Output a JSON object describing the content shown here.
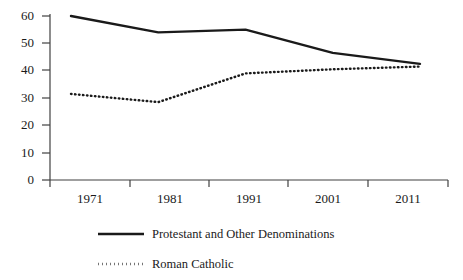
{
  "chart_data": {
    "type": "line",
    "title": "",
    "subtitle": "",
    "xlabel": "",
    "ylabel": "",
    "categories": [
      "1971",
      "1981",
      "1991",
      "2001",
      "2011"
    ],
    "x_tick_labels": [
      "1971",
      "1981",
      "1991",
      "2001",
      "2011"
    ],
    "y_tick_labels": [
      "0",
      "10",
      "20",
      "30",
      "40",
      "50",
      "60"
    ],
    "y_ticks": [
      0,
      10,
      20,
      30,
      40,
      50,
      60
    ],
    "ylim": [
      0,
      60
    ],
    "grid": false,
    "legend_position": "bottom-left",
    "series": [
      {
        "name": "Protestant and Other Denominations",
        "style": "solid",
        "color": "#1a1a1a",
        "values": [
          60,
          54,
          55,
          46.5,
          42.5
        ]
      },
      {
        "name": "Roman Catholic",
        "style": "dotted",
        "color": "#1a1a1a",
        "values": [
          31.5,
          28.5,
          39,
          40.5,
          41.5
        ]
      }
    ]
  },
  "legend": {
    "items": [
      {
        "label": "Protestant and Other Denominations",
        "style": "solid"
      },
      {
        "label": "Roman Catholic",
        "style": "dotted"
      }
    ]
  },
  "axis": {
    "y_labels": [
      "60",
      "50",
      "40",
      "30",
      "20",
      "10",
      "0"
    ],
    "x_labels": [
      "1971",
      "1981",
      "1991",
      "2001",
      "2011"
    ]
  },
  "colors": {
    "line": "#1a1a1a",
    "axis": "#404040",
    "background": "#ffffff"
  }
}
